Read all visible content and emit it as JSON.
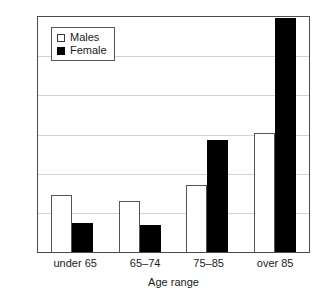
{
  "chart_data": {
    "type": "bar",
    "title": "",
    "xlabel": "Age range",
    "ylabel": "Excess deaths 2007/2008",
    "categories": [
      "under 65",
      "65–74",
      "75–85",
      "over 85"
    ],
    "series": [
      {
        "name": "Males",
        "color": "#ffffff",
        "edge_color": "#555555",
        "values": [
          1.45,
          1.3,
          1.72,
          3.04
        ]
      },
      {
        "name": "Female",
        "color": "#000000",
        "edge_color": "#000000",
        "values": [
          0.73,
          0.68,
          2.86,
          5.97
        ]
      }
    ],
    "ylim": [
      0,
      6
    ],
    "y_tick_labels": [],
    "gridlines": {
      "visible": true,
      "axis": "y",
      "count": 6,
      "color": "#d2d2d2"
    },
    "legend": {
      "position": "top-left",
      "entries": [
        "Males",
        "Female"
      ]
    },
    "frame": {
      "visible": true,
      "color": "#4a4a4a"
    }
  },
  "legend": {
    "males_label": "Males",
    "female_label": "Female"
  },
  "axes": {
    "y_title": "Excess deaths 2007/2008",
    "x_title": "Age range"
  }
}
